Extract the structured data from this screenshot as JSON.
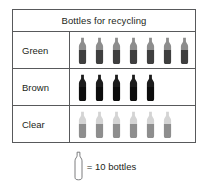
{
  "chart_data": {
    "type": "pictograph",
    "title": "Bottles for recycling",
    "categories": [
      "Green",
      "Brown",
      "Clear"
    ],
    "icon_counts": [
      7,
      5,
      6
    ],
    "values": [
      70,
      50,
      60
    ],
    "unit_per_icon": 10,
    "unit_label": "bottles",
    "legend": {
      "icon": "bottle-outline-icon",
      "text": "= 10 bottles"
    },
    "xlabel": "",
    "ylabel": "",
    "grid": true,
    "legend_position": "bottom-center",
    "colors": {
      "border": "#58595b",
      "text": "#231f20",
      "background": "#ffffff",
      "green_top": "#8d8d8d",
      "green_bottom": "#3f3f3f",
      "brown_top": "#1c1c1c",
      "brown_bottom": "#0d0d0d",
      "clear_top": "#d4d4d4",
      "clear_bottom": "#8e8e8e",
      "legend_outline": "#6d6e71"
    }
  },
  "table": {
    "title": "Bottles for recycling",
    "rows": [
      {
        "label": "Green",
        "icons": 7
      },
      {
        "label": "Brown",
        "icons": 5
      },
      {
        "label": "Clear",
        "icons": 6
      }
    ]
  },
  "legend": {
    "text": "= 10 bottles"
  }
}
